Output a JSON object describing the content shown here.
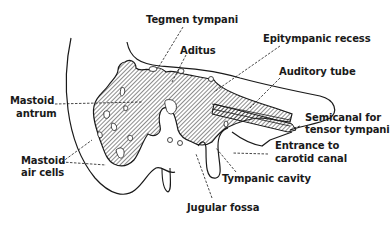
{
  "figure": {
    "ink_color": "#1a1a1a",
    "background": "#ffffff",
    "labels": {
      "tegmen_tympani": "Tegmen tympani",
      "aditus": "Aditus",
      "epitympanic_recess": "Epitympanic recess",
      "auditory_tube": "Auditory tube",
      "mastoid_antrum_1": "Mastoid",
      "mastoid_antrum_2": "antrum",
      "semicanal_1": "Semicanal for",
      "semicanal_2": "tensor tympani",
      "entrance_carotid_1": "Entrance to",
      "entrance_carotid_2": "carotid canal",
      "mastoid_air_cells_1": "Mastoid",
      "mastoid_air_cells_2": "air cells",
      "tympanic_cavity": "Tympanic cavity",
      "jugular_fossa": "Jugular fossa"
    }
  }
}
